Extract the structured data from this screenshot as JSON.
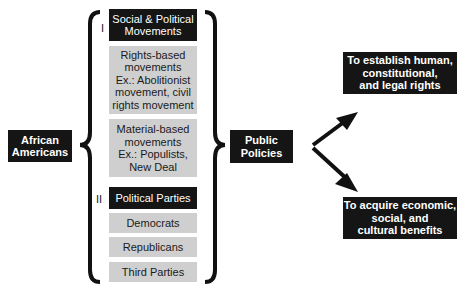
{
  "source": {
    "label": "African\nAmericans"
  },
  "section_1": {
    "numeral": "I",
    "header": "Social & Political\nMovements",
    "items": [
      "Rights-based\nmovements\nEx.: Abolitionist\nmovement, civil\nrights movement",
      "Material-based\nmovements\nEx.: Populists,\nNew Deal"
    ]
  },
  "section_2": {
    "numeral": "II",
    "header": "Political Parties",
    "items": [
      "Democrats",
      "Republicans",
      "Third Parties"
    ]
  },
  "middle": {
    "label": "Public\nPolicies"
  },
  "outcomes": [
    {
      "label": "To establish human,\nconstitutional,\nand legal rights"
    },
    {
      "label": "To acquire economic,\nsocial, and\ncultural benefits"
    }
  ],
  "colors": {
    "dark_box": "#151515",
    "light_box": "#cfcfcf",
    "text_light": "#ffffff"
  }
}
